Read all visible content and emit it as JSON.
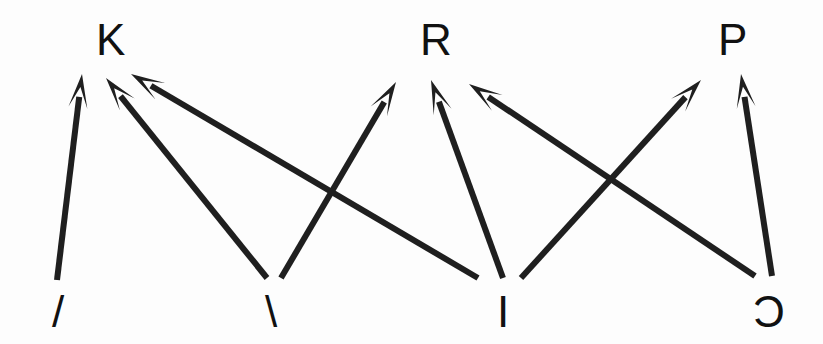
{
  "figure": {
    "type": "directed-graph",
    "background_color": "#fdfdfd",
    "stroke_color": "#1f1f1f",
    "text_color": "#111111",
    "width": 823,
    "height": 344
  },
  "nodes": {
    "top": [
      {
        "id": "K",
        "label": "K",
        "x": 96,
        "y": 18
      },
      {
        "id": "R",
        "label": "R",
        "x": 420,
        "y": 18
      },
      {
        "id": "P",
        "label": "P",
        "x": 718,
        "y": 18
      }
    ],
    "bottom": [
      {
        "id": "slash",
        "label": "/",
        "x": 52,
        "y": 290
      },
      {
        "id": "backslash",
        "label": "\\",
        "x": 265,
        "y": 290
      },
      {
        "id": "bar",
        "label": "I",
        "x": 497,
        "y": 290
      },
      {
        "id": "subset",
        "label": "Ɔ",
        "x": 753,
        "y": 290
      }
    ]
  },
  "edges": [
    {
      "from": "slash",
      "to": "K",
      "x1": 57,
      "y1": 280,
      "x2": 82,
      "y2": 74
    },
    {
      "from": "backslash",
      "to": "K",
      "x1": 267,
      "y1": 278,
      "x2": 106,
      "y2": 78
    },
    {
      "from": "bar",
      "to": "K",
      "x1": 478,
      "y1": 278,
      "x2": 131,
      "y2": 74
    },
    {
      "from": "backslash",
      "to": "R",
      "x1": 281,
      "y1": 278,
      "x2": 396,
      "y2": 82
    },
    {
      "from": "bar",
      "to": "R",
      "x1": 503,
      "y1": 278,
      "x2": 431,
      "y2": 80
    },
    {
      "from": "subset",
      "to": "R",
      "x1": 755,
      "y1": 276,
      "x2": 469,
      "y2": 84
    },
    {
      "from": "bar",
      "to": "P",
      "x1": 521,
      "y1": 278,
      "x2": 701,
      "y2": 80
    },
    {
      "from": "subset",
      "to": "P",
      "x1": 772,
      "y1": 276,
      "x2": 741,
      "y2": 74
    }
  ],
  "caption": {
    "title": "Directed graph: four source symbols point to three target letters"
  }
}
